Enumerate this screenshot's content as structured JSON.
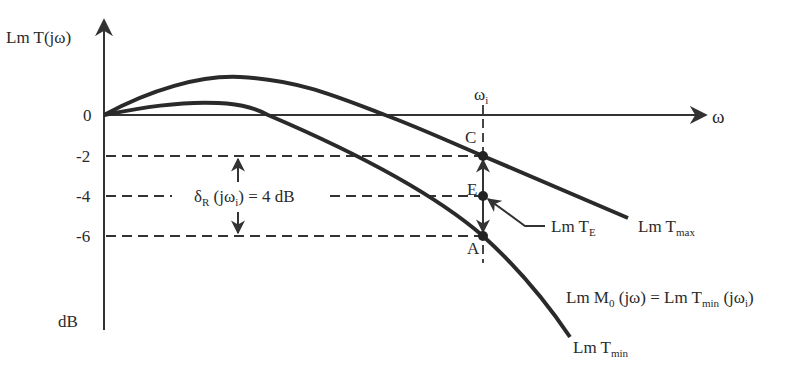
{
  "diagram": {
    "y_axis_label": "Lm T(jω)",
    "y_axis_unit": "dB",
    "x_axis_label": "ω",
    "y_ticks": [
      "0",
      "-2",
      "-4",
      "-6"
    ],
    "freq_marker": {
      "base": "ω",
      "sub": "i"
    },
    "points": {
      "C": "C",
      "E": "E",
      "A": "A"
    },
    "delta_label": {
      "delta": "δ",
      "sub": "R",
      "rest_open": " (jω",
      "rest_sub": "i",
      "rest_close": ") = 4 dB"
    },
    "te_label": {
      "base": "Lm T",
      "sub": "E"
    },
    "tmax_label": {
      "base": "Lm T",
      "sub": "max"
    },
    "tmin_label": {
      "base": "Lm T",
      "sub": "min"
    },
    "m0_equation": {
      "p1": "Lm M",
      "s1": "0",
      "p2": " (jω) = Lm T",
      "s2": "min",
      "p3": " (jω",
      "s3": "i",
      "p4": ")"
    }
  },
  "colors": {
    "curve": "#2a2a2a",
    "axis": "#333333",
    "background": "#ffffff"
  }
}
